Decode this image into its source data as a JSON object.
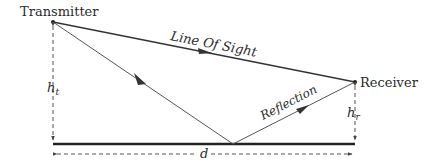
{
  "diagram": {
    "nodes": {
      "transmitter": {
        "label": "Transmitter",
        "x": 53,
        "y": 22
      },
      "receiver": {
        "label": "Receiver",
        "x": 355,
        "y": 82
      }
    },
    "paths": {
      "line_of_sight": {
        "label": "Line Of Sight"
      },
      "incident": {
        "label": ""
      },
      "reflection": {
        "label": "Reflection"
      }
    },
    "dimensions": {
      "transmitter_height": {
        "label": "h",
        "subscript": "t"
      },
      "receiver_height": {
        "label": "h",
        "subscript": "r"
      },
      "distance": {
        "label": "d"
      }
    },
    "ground": {
      "label": ""
    },
    "colors": {
      "line": "#333333",
      "ground": "#222222",
      "dashed": "#555555"
    }
  }
}
